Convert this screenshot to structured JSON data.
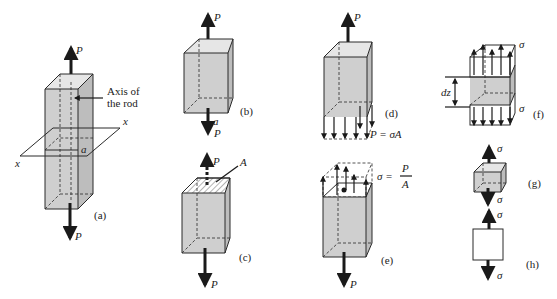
{
  "figure": {
    "panels": [
      {
        "id": "a",
        "tag": "(a)",
        "force_top": "P",
        "force_bottom": "P",
        "axis_label_line1": "Axis of",
        "axis_label_line2": "the rod",
        "plane_label_left": "x",
        "plane_label_right": "x",
        "section_label": "a"
      },
      {
        "id": "b",
        "tag": "(b)",
        "force_top": "P",
        "force_bottom": "P",
        "section_label": "a"
      },
      {
        "id": "c",
        "tag": "(c)",
        "force_top": "P",
        "force_bottom": "P",
        "area_label": "A"
      },
      {
        "id": "d",
        "tag": "(d)",
        "force_top": "P",
        "equation": "P = σA"
      },
      {
        "id": "e",
        "tag": "(e)",
        "force_bottom": "P",
        "eq_lhs": "σ =",
        "eq_num": "P",
        "eq_den": "A"
      },
      {
        "id": "f",
        "tag": "(f)",
        "stress_top": "σ",
        "stress_bottom": "σ",
        "length_label": "dz"
      },
      {
        "id": "g",
        "tag": "(g)",
        "stress_top": "σ",
        "stress_bottom": "σ"
      },
      {
        "id": "h",
        "tag": "(h)",
        "stress_top": "σ",
        "stress_bottom": "σ"
      }
    ]
  },
  "colors": {
    "fill": "#cfcfcf",
    "ink": "#1a1a1a",
    "background": "#ffffff"
  }
}
